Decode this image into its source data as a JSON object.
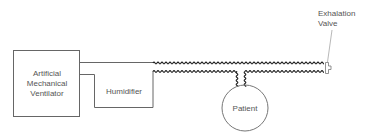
{
  "diagram": {
    "nodes": [
      {
        "id": "ventilator",
        "label_lines": [
          "Artificial",
          "Mechanical",
          "Ventilator"
        ],
        "shape": "rect"
      },
      {
        "id": "humidifier",
        "label": "Humidifier",
        "shape": "rect"
      },
      {
        "id": "patient",
        "label": "Patient",
        "shape": "circle"
      },
      {
        "id": "exhalation_valve",
        "label_lines": [
          "Exhalation",
          "Valve"
        ],
        "shape": "valve"
      }
    ],
    "edges": [
      {
        "from": "ventilator",
        "to": "humidifier",
        "style": "straight"
      },
      {
        "from": "humidifier",
        "to": "exhalation_valve",
        "style": "corrugated-tube"
      },
      {
        "from": "corrugated-tube",
        "to": "patient",
        "style": "corrugated-tube"
      }
    ],
    "colors": {
      "line": "#555555",
      "tube": "#222222",
      "text": "#555555"
    }
  },
  "labels": {
    "ventilator_l1": "Artificial",
    "ventilator_l2": "Mechanical",
    "ventilator_l3": "Ventilator",
    "humidifier": "Humidifier",
    "patient": "Patient",
    "valve_l1": "Exhalation",
    "valve_l2": "Valve"
  }
}
